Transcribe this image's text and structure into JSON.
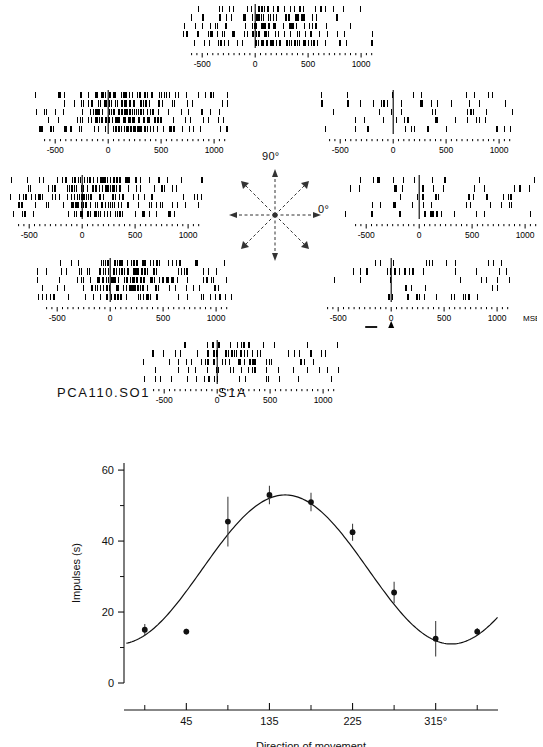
{
  "figure": {
    "unit_id": "PCA110.SO1",
    "condition": "S1A"
  },
  "compass": {
    "label_top": "90°",
    "label_right": "0°",
    "directions_deg": [
      0,
      45,
      90,
      135,
      180,
      225,
      270,
      315
    ]
  },
  "raster_axis": {
    "tick_labels": [
      "-500",
      "0",
      "500",
      "1000"
    ],
    "tick_values": [
      -500,
      0,
      500,
      1000
    ],
    "unit_label": "MSEC",
    "event_markers": [
      {
        "label": "T",
        "name": "target-onset"
      },
      {
        "label": "M",
        "name": "movement-onset"
      }
    ]
  },
  "rasters": [
    {
      "name": "raster-90",
      "direction_deg": 90,
      "trials": 5,
      "activity": "high"
    },
    {
      "name": "raster-135",
      "direction_deg": 135,
      "trials": 5,
      "activity": "very-high"
    },
    {
      "name": "raster-45",
      "direction_deg": 45,
      "trials": 5,
      "activity": "low"
    },
    {
      "name": "raster-180",
      "direction_deg": 180,
      "trials": 5,
      "activity": "very-high"
    },
    {
      "name": "raster-0",
      "direction_deg": 0,
      "trials": 5,
      "activity": "low"
    },
    {
      "name": "raster-225",
      "direction_deg": 225,
      "trials": 5,
      "activity": "high"
    },
    {
      "name": "raster-315",
      "direction_deg": 315,
      "trials": 5,
      "activity": "low"
    },
    {
      "name": "raster-270",
      "direction_deg": 270,
      "trials": 5,
      "activity": "medium"
    }
  ],
  "chart_data": {
    "type": "scatter",
    "title": "",
    "xlabel": "Direction of movement",
    "ylabel": "Impulses (s)",
    "xlim": [
      -22.5,
      382.5
    ],
    "ylim": [
      0,
      62
    ],
    "grid": false,
    "legend": "none",
    "x": [
      0,
      45,
      90,
      135,
      180,
      225,
      270,
      315,
      360
    ],
    "values": [
      15.0,
      14.5,
      45.5,
      53.0,
      51.0,
      42.5,
      25.5,
      12.5,
      14.5
    ],
    "errors": [
      1.6,
      0.8,
      7.0,
      2.6,
      2.6,
      2.4,
      3.0,
      5.0,
      1.0
    ],
    "xticks_major": [
      45,
      135,
      225,
      315
    ],
    "xtick_labels": [
      "45",
      "135",
      "225",
      "315°"
    ],
    "xticks_minor": [
      0,
      90,
      180,
      270,
      360
    ],
    "yticks_major": [
      0,
      20,
      40,
      60
    ],
    "ytick_labels": [
      "0",
      "20",
      "40",
      "60"
    ],
    "yticks_minor": [
      10,
      30,
      50
    ],
    "fit": {
      "type": "cosine",
      "baseline": 32.0,
      "amplitude": 21.0,
      "preferred_direction_deg": 152
    }
  }
}
